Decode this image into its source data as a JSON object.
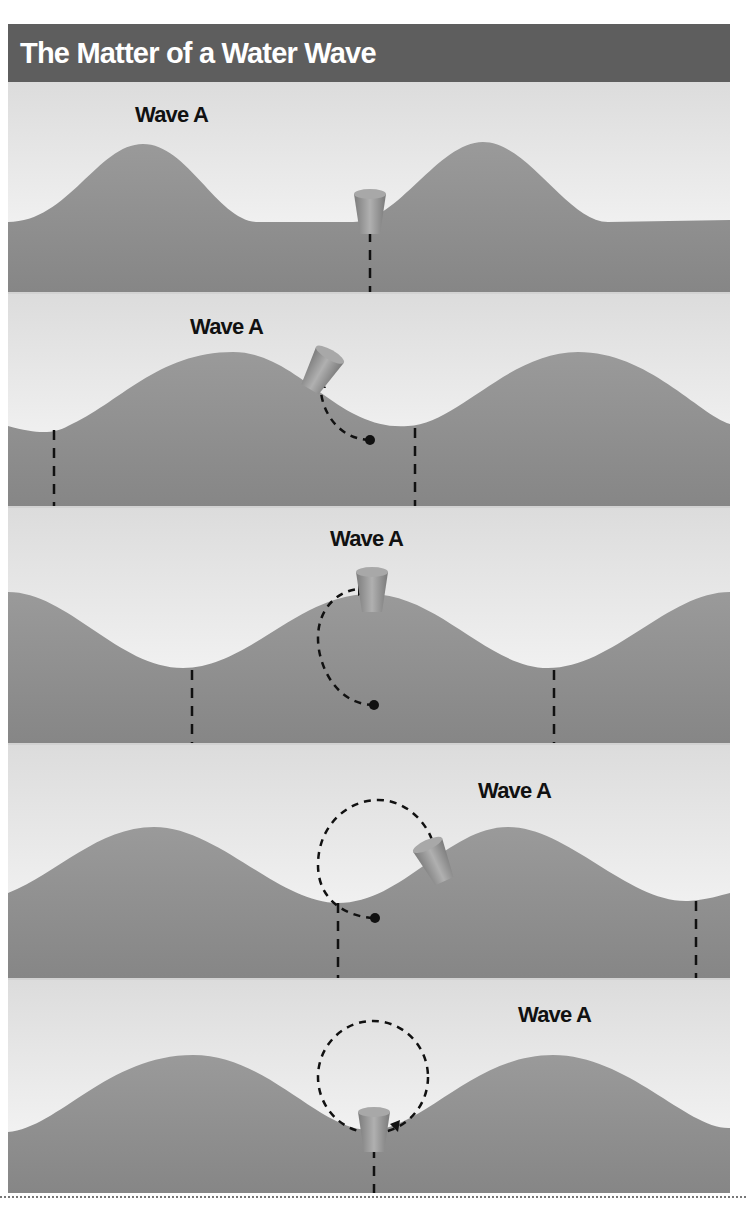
{
  "title": "The Matter of a Water Wave",
  "colors": {
    "title_bar": "#5e5e5e",
    "title_text": "#ffffff",
    "sky": "#ececec",
    "water": "#8c8c8c",
    "cork": "#9a9a9a",
    "dashed_lines": "#111111"
  },
  "panels": [
    {
      "label": "Wave A",
      "stage": 1,
      "cork_position": "trough",
      "path_shown": "none"
    },
    {
      "label": "Wave A",
      "stage": 2,
      "cork_position": "rising front slope",
      "path_shown": "quarter arc"
    },
    {
      "label": "Wave A",
      "stage": 3,
      "cork_position": "crest",
      "path_shown": "half arc"
    },
    {
      "label": "Wave A",
      "stage": 4,
      "cork_position": "falling back slope",
      "path_shown": "three-quarter circle"
    },
    {
      "label": "Wave A",
      "stage": 5,
      "cork_position": "trough",
      "path_shown": "full circle"
    }
  ],
  "icons": {
    "cork": "cork-icon",
    "orbit": "dashed-orbit-path",
    "wavelength_marker": "dashed-vertical-line"
  }
}
